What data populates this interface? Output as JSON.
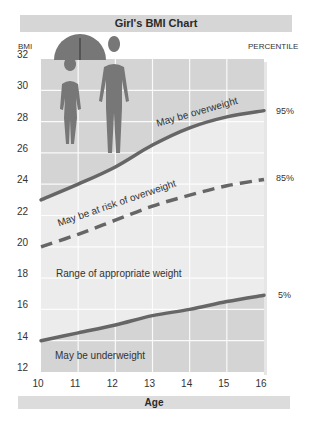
{
  "title": "Girl's BMI Chart",
  "y_axis_label": "BMI",
  "right_axis_label": "PERCENTILE",
  "x_axis_label": "Age",
  "y_ticks": [
    "32",
    "30",
    "28",
    "26",
    "24",
    "22",
    "20",
    "18",
    "16",
    "14",
    "12"
  ],
  "x_ticks": [
    "10",
    "11",
    "12",
    "13",
    "14",
    "15",
    "16"
  ],
  "percentile_labels": {
    "p95": "95%",
    "p85": "85%",
    "p5": "5%"
  },
  "region_labels": {
    "overweight": "May be overweight",
    "risk": "May be at risk of overweight",
    "appropriate": "Range of appropriate weight",
    "underweight": "May be underweight"
  },
  "colors": {
    "title_bar": "#d6d6d6",
    "overweight_region": "#d4d4d4",
    "appropriate_region": "#ececec",
    "underweight_region": "#d4d4d4",
    "curve": "#666666",
    "figure": "#777777"
  },
  "chart_data": {
    "type": "line",
    "title": "Girl's BMI Chart",
    "xlabel": "Age",
    "ylabel": "BMI",
    "x": [
      10,
      11,
      12,
      13,
      14,
      15,
      16
    ],
    "xlim": [
      10,
      16
    ],
    "ylim": [
      12,
      32
    ],
    "grid": true,
    "series": [
      {
        "name": "95%",
        "style": "solid",
        "values": [
          23.0,
          24.0,
          25.1,
          26.5,
          27.6,
          28.3,
          28.7
        ]
      },
      {
        "name": "85%",
        "style": "dashed",
        "values": [
          20.0,
          20.8,
          21.7,
          22.6,
          23.3,
          23.9,
          24.3
        ]
      },
      {
        "name": "5%",
        "style": "solid",
        "values": [
          14.0,
          14.5,
          15.0,
          15.6,
          16.0,
          16.5,
          16.9
        ]
      }
    ],
    "regions": [
      {
        "label": "May be overweight",
        "between": [
          "95%",
          "top"
        ]
      },
      {
        "label": "May be at risk of overweight",
        "between": [
          "85%",
          "95%"
        ]
      },
      {
        "label": "Range of appropriate weight",
        "between": [
          "5%",
          "85%"
        ]
      },
      {
        "label": "May be underweight",
        "between": [
          "bottom",
          "5%"
        ]
      }
    ],
    "legend": "percentile labels on right side"
  }
}
